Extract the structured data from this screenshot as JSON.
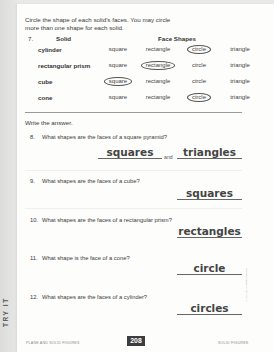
{
  "instructions": {
    "line1": "Circle the shape of each solid's faces. You may circle",
    "line2": "more than one shape for each solid."
  },
  "table": {
    "number": "7.",
    "header_solid": "Solid",
    "header_faces": "Face Shapes",
    "options": [
      "square",
      "rectangle",
      "circle",
      "triangle"
    ],
    "rows": [
      {
        "solid": "cylinder",
        "circled": [
          "circle"
        ]
      },
      {
        "solid": "rectangular prism",
        "circled": [
          "rectangle"
        ]
      },
      {
        "solid": "cube",
        "circled": [
          "square"
        ]
      },
      {
        "solid": "cone",
        "circled": [
          "circle"
        ]
      }
    ]
  },
  "write_section": {
    "label": "Write the answer.",
    "questions": [
      {
        "number": "8.",
        "text": "What shapes are the faces of a square pyramid?",
        "answers": [
          "squares",
          "triangles"
        ],
        "joiner": "and"
      },
      {
        "number": "9.",
        "text": "What shapes are the faces of a cube?",
        "answers": [
          "squares"
        ]
      },
      {
        "number": "10.",
        "text": "What shapes are the faces of a rectangular prism?",
        "answers": [
          "rectangles"
        ]
      },
      {
        "number": "11.",
        "text": "What shape is the face of a cone?",
        "answers": [
          "circle"
        ]
      },
      {
        "number": "12.",
        "text": "What shapes are the faces of a cylinder?",
        "answers": [
          "circles"
        ]
      }
    ]
  },
  "side_tab": "TRY IT",
  "footer": {
    "left": "PLANE AND SOLID FIGURES",
    "page_number": "208",
    "right": "SOLID FIGURES",
    "copyright": "© K12 Inc. All rights reserved."
  }
}
